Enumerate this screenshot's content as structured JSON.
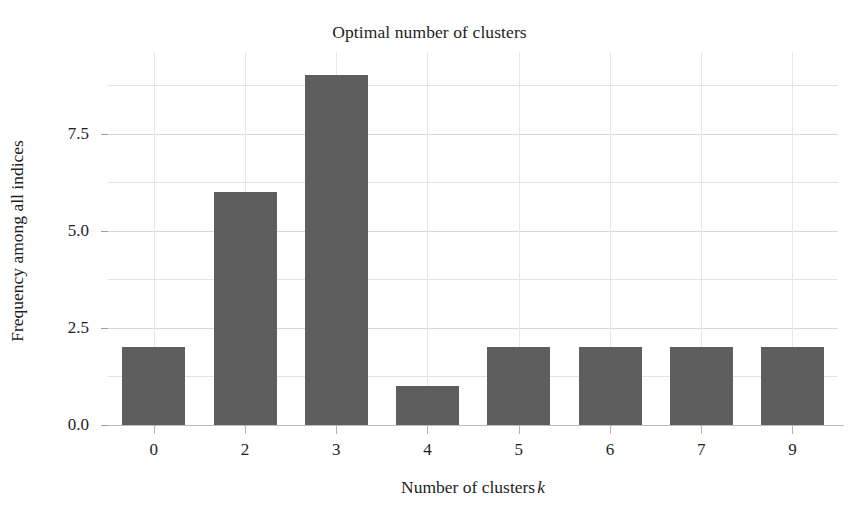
{
  "chart_data": {
    "type": "bar",
    "title": "Optimal number of clusters",
    "xlabel": "Number of clusters",
    "xlabel_symbol": "k",
    "ylabel": "Frequency among all indices",
    "categories": [
      "0",
      "2",
      "3",
      "4",
      "5",
      "6",
      "7",
      "9"
    ],
    "values": [
      2,
      6,
      9,
      1,
      2,
      2,
      2,
      2
    ],
    "ylim": [
      0,
      9.6
    ],
    "ytick_values": [
      0.0,
      2.5,
      5.0,
      7.5
    ],
    "ytick_labels": [
      "0.0",
      "2.5",
      "5.0",
      "7.5"
    ],
    "minor_gridline_values": [
      1.25,
      3.75,
      6.25,
      8.75
    ],
    "grid": true,
    "legend": null,
    "bar_color": "#5e5e5e",
    "background_color": "#ffffff",
    "gridline_color": "#e3e3e3",
    "axis_line_color": "#bdbdbd"
  }
}
